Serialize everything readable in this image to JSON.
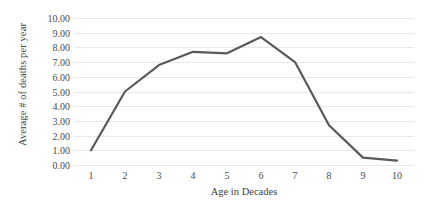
{
  "chart_data": {
    "type": "line",
    "title": "",
    "xlabel": "Age in Decades",
    "ylabel": "Average # of deaths per year",
    "categories": [
      "1",
      "2",
      "3",
      "4",
      "5",
      "6",
      "7",
      "8",
      "9",
      "10"
    ],
    "x": [
      1,
      2,
      3,
      4,
      5,
      6,
      7,
      8,
      9,
      10
    ],
    "values": [
      1.0,
      5.0,
      6.8,
      7.7,
      7.6,
      8.7,
      7.0,
      2.7,
      0.5,
      0.3
    ],
    "series": [
      {
        "name": "Average # of deaths per year",
        "values": [
          1.0,
          5.0,
          6.8,
          7.7,
          7.6,
          8.7,
          7.0,
          2.7,
          0.5,
          0.3
        ],
        "color": "#595959"
      }
    ],
    "ylim": [
      0,
      10
    ],
    "ytick_labels": [
      "10.00",
      "9.00",
      "8.00",
      "7.00",
      "6.00",
      "5.00",
      "4.00",
      "3.00",
      "2.00",
      "1.00",
      "0.00"
    ],
    "ytick_values": [
      10,
      9,
      8,
      7,
      6,
      5,
      4,
      3,
      2,
      1,
      0
    ],
    "xtick_labels": [
      "1",
      "2",
      "3",
      "4",
      "5",
      "6",
      "7",
      "8",
      "9",
      "10"
    ],
    "grid": "horizontal",
    "legend": "none",
    "line_color": "#595959",
    "line_width": 2.2,
    "gridline_color": "#e8e8e8",
    "background": "#ffffff",
    "markers": "none"
  }
}
